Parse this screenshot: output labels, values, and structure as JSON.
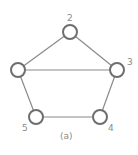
{
  "diagram": {
    "type": "graph",
    "caption": "(a)",
    "nodes": [
      {
        "id": "1",
        "label": "",
        "x": 18,
        "y": 70
      },
      {
        "id": "2",
        "label": "2",
        "x": 70,
        "y": 32
      },
      {
        "id": "3",
        "label": "3",
        "x": 117,
        "y": 70
      },
      {
        "id": "4",
        "label": "4",
        "x": 100,
        "y": 117
      },
      {
        "id": "5",
        "label": "5",
        "x": 36,
        "y": 117
      }
    ],
    "edges": [
      {
        "from": "1",
        "to": "2"
      },
      {
        "from": "2",
        "to": "3"
      },
      {
        "from": "1",
        "to": "3"
      },
      {
        "from": "1",
        "to": "5"
      },
      {
        "from": "5",
        "to": "4"
      },
      {
        "from": "4",
        "to": "3"
      }
    ],
    "colors": {
      "node_stroke": "#6e6e6e",
      "edge": "#8a8a8a",
      "label": "#8a8a8a",
      "background": "#ffffff"
    }
  }
}
